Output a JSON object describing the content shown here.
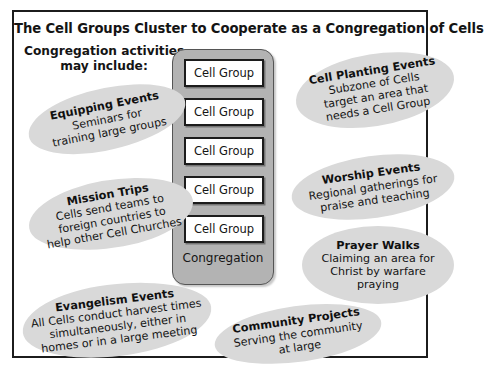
{
  "diagram": {
    "title": "The Cell Groups Cluster to Cooperate as a Congregation of Cells",
    "intro": {
      "line1": "Congregation activities",
      "line2": "may include:"
    },
    "congregation": {
      "label": "Congregation",
      "cell_groups": [
        "Cell Group",
        "Cell Group",
        "Cell Group",
        "Cell Group",
        "Cell Group"
      ]
    },
    "activities": [
      {
        "id": "equipping",
        "title": "Equipping Events",
        "lines": [
          "Seminars for",
          "training large groups"
        ]
      },
      {
        "id": "mission",
        "title": "Mission Trips",
        "lines": [
          "Cells send teams to",
          "foreign countries to",
          "help other Cell Churches"
        ]
      },
      {
        "id": "evangelism",
        "title": "Evangelism Events",
        "lines": [
          "All Cells conduct harvest times",
          "simultaneously, either in",
          "homes or in a large meeting"
        ]
      },
      {
        "id": "community",
        "title": "Community Projects",
        "lines": [
          "Serving the community",
          "at large"
        ]
      },
      {
        "id": "planting",
        "title": "Cell Planting Events",
        "lines": [
          "Subzone of Cells",
          "target an area that",
          "needs a Cell Group"
        ]
      },
      {
        "id": "worship",
        "title": "Worship Events",
        "lines": [
          "Regional gatherings for",
          "praise and teaching"
        ]
      },
      {
        "id": "prayer",
        "title": "Prayer Walks",
        "lines": [
          "Claiming an area for",
          "Christ by warfare",
          "praying"
        ]
      }
    ],
    "colors": {
      "frame_border": "#1c1c1c",
      "blob_fill": "#d9d9d9",
      "congregation_fill": "#b3b3b3",
      "cell_group_fill": "#ffffff",
      "text": "#141414"
    }
  }
}
